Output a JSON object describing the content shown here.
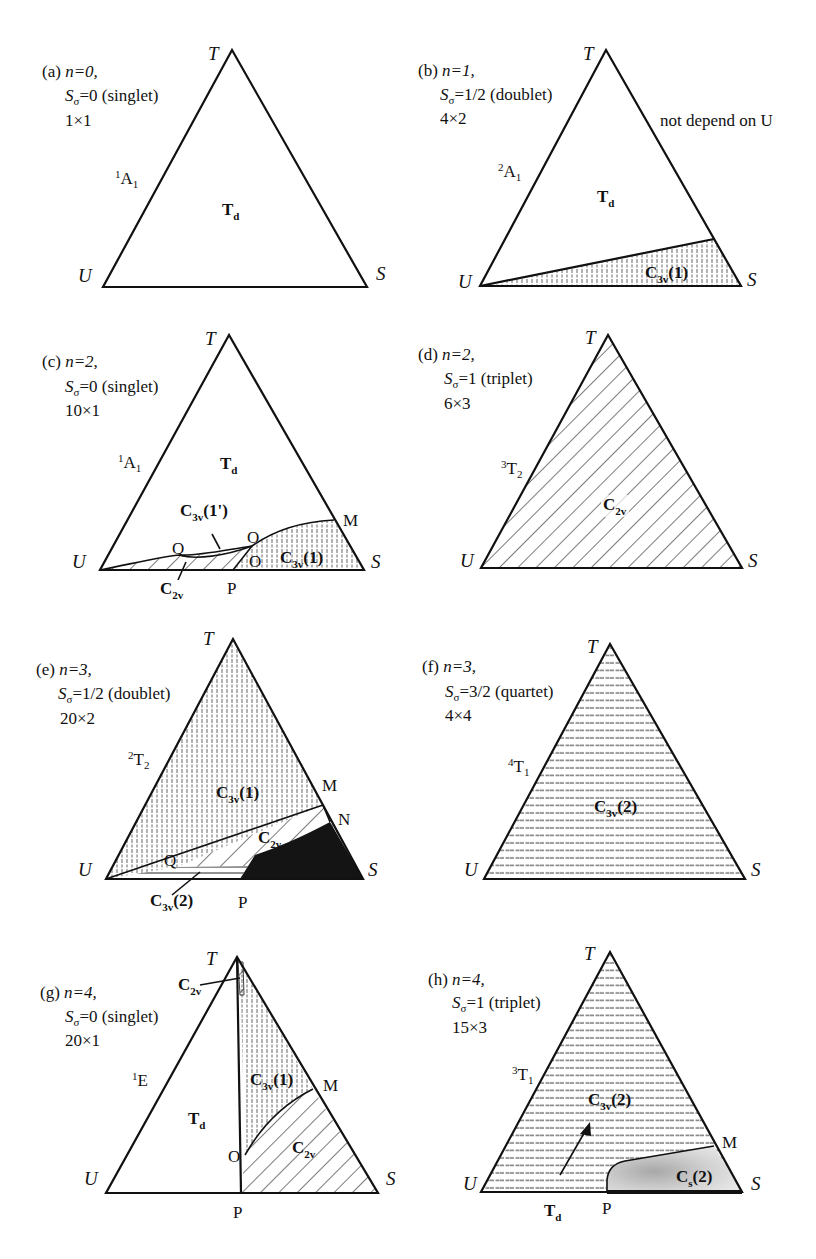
{
  "figure": {
    "vertex_labels": {
      "top": "T",
      "left": "U",
      "right": "S"
    },
    "panels": [
      {
        "id": "a",
        "tag": "(a)",
        "n": "n=0,",
        "spin_prefix": "S",
        "spin_sub": "σ",
        "spin_value": "=0 (singlet)",
        "dim": "1×1",
        "state_sup": "1",
        "state_main": "A",
        "state_sub": "1",
        "regions": [
          {
            "main": "T",
            "sub": "d"
          }
        ],
        "note": ""
      },
      {
        "id": "b",
        "tag": "(b)",
        "n": "n=1,",
        "spin_prefix": "S",
        "spin_sub": "σ",
        "spin_value": "=1/2 (doublet)",
        "dim": "4×2",
        "state_sup": "2",
        "state_main": "A",
        "state_sub": "1",
        "regions": [
          {
            "main": "T",
            "sub": "d"
          },
          {
            "main": "C",
            "sub": "3v",
            "suffix": "(1)"
          }
        ],
        "note": "not depend on U"
      },
      {
        "id": "c",
        "tag": "(c)",
        "n": "n=2,",
        "spin_prefix": "S",
        "spin_sub": "σ",
        "spin_value": "=0 (singlet)",
        "dim": "10×1",
        "state_sup": "1",
        "state_main": "A",
        "state_sub": "1",
        "regions": [
          {
            "main": "T",
            "sub": "d"
          },
          {
            "main": "C",
            "sub": "3v",
            "suffix": "(1')"
          },
          {
            "main": "C",
            "sub": "3v",
            "suffix": "(1)"
          },
          {
            "main": "C",
            "sub": "2v",
            "suffix": ""
          }
        ],
        "points": [
          "Q",
          "O",
          "O",
          "M",
          "P"
        ],
        "note": ""
      },
      {
        "id": "d",
        "tag": "(d)",
        "n": "n=2,",
        "spin_prefix": "S",
        "spin_sub": "σ",
        "spin_value": "=1 (triplet)",
        "dim": "6×3",
        "state_sup": "3",
        "state_main": "T",
        "state_sub": "2",
        "regions": [
          {
            "main": "C",
            "sub": "2v",
            "suffix": ""
          }
        ],
        "note": ""
      },
      {
        "id": "e",
        "tag": "(e)",
        "n": "n=3,",
        "spin_prefix": "S",
        "spin_sub": "σ",
        "spin_value": "=1/2 (doublet)",
        "dim": "20×2",
        "state_sup": "2",
        "state_main": "T",
        "state_sub": "2",
        "regions": [
          {
            "main": "C",
            "sub": "3v",
            "suffix": "(1)"
          },
          {
            "main": "C",
            "sub": "2v",
            "suffix": ""
          },
          {
            "main": "C",
            "sub": "3v",
            "suffix": "(2)"
          }
        ],
        "points": [
          "M",
          "N",
          "Q",
          "P"
        ],
        "note": ""
      },
      {
        "id": "f",
        "tag": "(f)",
        "n": "n=3,",
        "spin_prefix": "S",
        "spin_sub": "σ",
        "spin_value": "=3/2 (quartet)",
        "dim": "4×4",
        "state_sup": "4",
        "state_main": "T",
        "state_sub": "1",
        "regions": [
          {
            "main": "C",
            "sub": "3v",
            "suffix": "(2)"
          }
        ],
        "note": ""
      },
      {
        "id": "g",
        "tag": "(g)",
        "n": "n=4,",
        "spin_prefix": "S",
        "spin_sub": "σ",
        "spin_value": "=0 (singlet)",
        "dim": "20×1",
        "state_sup": "1",
        "state_main": "E",
        "state_sub": "",
        "regions": [
          {
            "main": "T",
            "sub": "d"
          },
          {
            "main": "C",
            "sub": "2v",
            "suffix": ""
          },
          {
            "main": "C",
            "sub": "3v",
            "suffix": "(1)"
          },
          {
            "main": "C",
            "sub": "2v",
            "suffix": ""
          }
        ],
        "points": [
          "M",
          "O",
          "P"
        ],
        "note": ""
      },
      {
        "id": "h",
        "tag": "(h)",
        "n": "n=4,",
        "spin_prefix": "S",
        "spin_sub": "σ",
        "spin_value": "=1 (triplet)",
        "dim": "15×3",
        "state_sup": "3",
        "state_main": "T",
        "state_sub": "1",
        "regions": [
          {
            "main": "C",
            "sub": "3v",
            "suffix": "(2)"
          },
          {
            "main": "C",
            "sub": "s",
            "suffix": "(2)"
          },
          {
            "main": "T",
            "sub": "d"
          }
        ],
        "points": [
          "M",
          "P"
        ],
        "note": ""
      }
    ]
  }
}
